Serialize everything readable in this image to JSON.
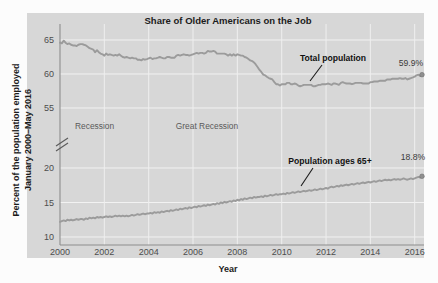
{
  "chart_data": {
    "type": "line",
    "title": "Share of Older Americans on the Job",
    "xlabel": "Year",
    "ylabel": "Percent of the population employed",
    "ylabel_line2": "January 2000–May 2016",
    "xlim": [
      2000,
      2016.42
    ],
    "x_ticks": [
      "2000",
      "2002",
      "2004",
      "2006",
      "2008",
      "2010",
      "2012",
      "2014",
      "2016"
    ],
    "x_tick_values": [
      2000,
      2002,
      2004,
      2006,
      2008,
      2010,
      2012,
      2014,
      2016
    ],
    "y_ticks_upper": [
      "65",
      "60",
      "55"
    ],
    "y_tick_values_upper": [
      65,
      60,
      55
    ],
    "y_ticks_lower": [
      "20",
      "15",
      "10"
    ],
    "y_tick_values_lower": [
      20,
      15,
      10
    ],
    "axis_break": true,
    "axis_break_note": "y-axis broken between 55 and 20",
    "grid": true,
    "legend_position": "inline-annotations",
    "line_color": "#9b9b9b",
    "panel_color": "#d7d7d7",
    "gridline_color": "#f2f2f2",
    "annotations": [
      {
        "name": "recession-2001",
        "text": "Recession",
        "x": 2001.1,
        "y": 51.0
      },
      {
        "name": "great-recession",
        "text": "Great Recession",
        "x": 2007.0,
        "y": 51.0
      },
      {
        "name": "total-population",
        "text": "Total population",
        "x": 2012.6,
        "y": 62.3
      },
      {
        "name": "population-65-plus",
        "text": "Population ages 65+",
        "x": 2012.4,
        "y": 21.6
      }
    ],
    "end_labels": [
      {
        "series": "Total population",
        "text": "59.9%",
        "value": 59.9
      },
      {
        "series": "Population ages 65+",
        "text": "18.8%",
        "value": 18.8
      }
    ],
    "series": [
      {
        "name": "Total population",
        "end_value": 59.9,
        "end_label": "59.9%",
        "x": [
          2000.0,
          2000.08,
          2000.17,
          2000.25,
          2000.33,
          2000.42,
          2000.5,
          2000.58,
          2000.67,
          2000.75,
          2000.83,
          2000.92,
          2001.0,
          2001.08,
          2001.17,
          2001.25,
          2001.33,
          2001.42,
          2001.5,
          2001.58,
          2001.67,
          2001.75,
          2001.83,
          2001.92,
          2002.0,
          2002.08,
          2002.17,
          2002.25,
          2002.33,
          2002.42,
          2002.5,
          2002.58,
          2002.67,
          2002.75,
          2002.83,
          2002.92,
          2003.0,
          2003.08,
          2003.17,
          2003.25,
          2003.33,
          2003.42,
          2003.5,
          2003.58,
          2003.67,
          2003.75,
          2003.83,
          2003.92,
          2004.0,
          2004.08,
          2004.17,
          2004.25,
          2004.33,
          2004.42,
          2004.5,
          2004.58,
          2004.67,
          2004.75,
          2004.83,
          2004.92,
          2005.0,
          2005.08,
          2005.17,
          2005.25,
          2005.33,
          2005.42,
          2005.5,
          2005.58,
          2005.67,
          2005.75,
          2005.83,
          2005.92,
          2006.0,
          2006.08,
          2006.17,
          2006.25,
          2006.33,
          2006.42,
          2006.5,
          2006.58,
          2006.67,
          2006.75,
          2006.83,
          2006.92,
          2007.0,
          2007.08,
          2007.17,
          2007.25,
          2007.33,
          2007.42,
          2007.5,
          2007.58,
          2007.67,
          2007.75,
          2007.83,
          2007.92,
          2008.0,
          2008.08,
          2008.17,
          2008.25,
          2008.33,
          2008.42,
          2008.5,
          2008.58,
          2008.67,
          2008.75,
          2008.83,
          2008.92,
          2009.0,
          2009.08,
          2009.17,
          2009.25,
          2009.33,
          2009.42,
          2009.5,
          2009.58,
          2009.67,
          2009.75,
          2009.83,
          2009.92,
          2010.0,
          2010.08,
          2010.17,
          2010.25,
          2010.33,
          2010.42,
          2010.5,
          2010.58,
          2010.67,
          2010.75,
          2010.83,
          2010.92,
          2011.0,
          2011.08,
          2011.17,
          2011.25,
          2011.33,
          2011.42,
          2011.5,
          2011.58,
          2011.67,
          2011.75,
          2011.83,
          2011.92,
          2012.0,
          2012.08,
          2012.17,
          2012.25,
          2012.33,
          2012.42,
          2012.5,
          2012.58,
          2012.67,
          2012.75,
          2012.83,
          2012.92,
          2013.0,
          2013.08,
          2013.17,
          2013.25,
          2013.33,
          2013.42,
          2013.5,
          2013.58,
          2013.67,
          2013.75,
          2013.83,
          2013.92,
          2014.0,
          2014.08,
          2014.17,
          2014.25,
          2014.33,
          2014.42,
          2014.5,
          2014.58,
          2014.67,
          2014.75,
          2014.83,
          2014.92,
          2015.0,
          2015.08,
          2015.17,
          2015.25,
          2015.33,
          2015.42,
          2015.5,
          2015.58,
          2015.67,
          2015.75,
          2015.83,
          2015.92,
          2016.0,
          2016.08,
          2016.17,
          2016.25,
          2016.33
        ],
        "y": [
          64.6,
          64.5,
          64.9,
          64.6,
          64.4,
          64.5,
          64.3,
          64.2,
          64.2,
          64.1,
          64.3,
          64.4,
          64.4,
          64.3,
          64.2,
          64.0,
          63.8,
          63.7,
          63.6,
          63.2,
          63.5,
          63.2,
          63.0,
          62.9,
          62.7,
          63.0,
          62.8,
          62.9,
          62.8,
          62.7,
          62.8,
          62.7,
          62.9,
          62.7,
          62.5,
          62.4,
          62.5,
          62.4,
          62.3,
          62.4,
          62.3,
          62.3,
          62.1,
          62.1,
          62.0,
          62.2,
          62.1,
          62.2,
          62.3,
          62.4,
          62.2,
          62.3,
          62.3,
          62.4,
          62.5,
          62.4,
          62.3,
          62.3,
          62.5,
          62.5,
          62.4,
          62.4,
          62.4,
          62.7,
          62.8,
          62.7,
          62.8,
          62.9,
          62.8,
          62.8,
          62.7,
          62.8,
          62.9,
          63.0,
          63.1,
          63.0,
          63.1,
          63.1,
          63.0,
          63.1,
          63.4,
          63.3,
          63.3,
          63.4,
          63.3,
          63.0,
          63.0,
          63.0,
          63.0,
          63.0,
          62.9,
          62.7,
          62.9,
          62.7,
          62.9,
          62.7,
          62.9,
          62.8,
          62.7,
          62.7,
          62.5,
          62.4,
          62.2,
          62.0,
          61.9,
          61.7,
          61.4,
          61.0,
          60.6,
          60.3,
          59.9,
          59.8,
          59.6,
          59.4,
          59.3,
          59.2,
          58.8,
          58.5,
          58.5,
          58.3,
          58.5,
          58.5,
          58.5,
          58.7,
          58.7,
          58.5,
          58.5,
          58.6,
          58.5,
          58.3,
          58.2,
          58.3,
          58.4,
          58.4,
          58.4,
          58.4,
          58.4,
          58.2,
          58.2,
          58.3,
          58.4,
          58.4,
          58.5,
          58.5,
          58.5,
          58.6,
          58.5,
          58.4,
          58.6,
          58.6,
          58.5,
          58.4,
          58.7,
          58.8,
          58.7,
          58.6,
          58.6,
          58.6,
          58.5,
          58.6,
          58.7,
          58.7,
          58.7,
          58.7,
          58.6,
          58.6,
          58.6,
          58.6,
          58.8,
          58.8,
          58.9,
          58.9,
          58.9,
          59.0,
          59.0,
          59.0,
          59.0,
          59.2,
          59.2,
          59.2,
          59.3,
          59.3,
          59.3,
          59.3,
          59.4,
          59.3,
          59.3,
          59.4,
          59.2,
          59.3,
          59.4,
          59.5,
          59.6,
          59.8,
          59.9,
          59.7,
          59.9
        ]
      },
      {
        "name": "Population ages 65+",
        "end_value": 18.8,
        "end_label": "18.8%",
        "x": [
          2000.0,
          2000.08,
          2000.17,
          2000.25,
          2000.33,
          2000.42,
          2000.5,
          2000.58,
          2000.67,
          2000.75,
          2000.83,
          2000.92,
          2001.0,
          2001.08,
          2001.17,
          2001.25,
          2001.33,
          2001.42,
          2001.5,
          2001.58,
          2001.67,
          2001.75,
          2001.83,
          2001.92,
          2002.0,
          2002.08,
          2002.17,
          2002.25,
          2002.33,
          2002.42,
          2002.5,
          2002.58,
          2002.67,
          2002.75,
          2002.83,
          2002.92,
          2003.0,
          2003.08,
          2003.17,
          2003.25,
          2003.33,
          2003.42,
          2003.5,
          2003.58,
          2003.67,
          2003.75,
          2003.83,
          2003.92,
          2004.0,
          2004.08,
          2004.17,
          2004.25,
          2004.33,
          2004.42,
          2004.5,
          2004.58,
          2004.67,
          2004.75,
          2004.83,
          2004.92,
          2005.0,
          2005.08,
          2005.17,
          2005.25,
          2005.33,
          2005.42,
          2005.5,
          2005.58,
          2005.67,
          2005.75,
          2005.83,
          2005.92,
          2006.0,
          2006.08,
          2006.17,
          2006.25,
          2006.33,
          2006.42,
          2006.5,
          2006.58,
          2006.67,
          2006.75,
          2006.83,
          2006.92,
          2007.0,
          2007.08,
          2007.17,
          2007.25,
          2007.33,
          2007.42,
          2007.5,
          2007.58,
          2007.67,
          2007.75,
          2007.83,
          2007.92,
          2008.0,
          2008.08,
          2008.17,
          2008.25,
          2008.33,
          2008.42,
          2008.5,
          2008.58,
          2008.67,
          2008.75,
          2008.83,
          2008.92,
          2009.0,
          2009.08,
          2009.17,
          2009.25,
          2009.33,
          2009.42,
          2009.5,
          2009.58,
          2009.67,
          2009.75,
          2009.83,
          2009.92,
          2010.0,
          2010.08,
          2010.17,
          2010.25,
          2010.33,
          2010.42,
          2010.5,
          2010.58,
          2010.67,
          2010.75,
          2010.83,
          2010.92,
          2011.0,
          2011.08,
          2011.17,
          2011.25,
          2011.33,
          2011.42,
          2011.5,
          2011.58,
          2011.67,
          2011.75,
          2011.83,
          2011.92,
          2012.0,
          2012.08,
          2012.17,
          2012.25,
          2012.33,
          2012.42,
          2012.5,
          2012.58,
          2012.67,
          2012.75,
          2012.83,
          2012.92,
          2013.0,
          2013.08,
          2013.17,
          2013.25,
          2013.33,
          2013.42,
          2013.5,
          2013.58,
          2013.67,
          2013.75,
          2013.83,
          2013.92,
          2014.0,
          2014.08,
          2014.17,
          2014.25,
          2014.33,
          2014.42,
          2014.5,
          2014.58,
          2014.67,
          2014.75,
          2014.83,
          2014.92,
          2015.0,
          2015.08,
          2015.17,
          2015.25,
          2015.33,
          2015.42,
          2015.5,
          2015.58,
          2015.67,
          2015.75,
          2015.83,
          2015.92,
          2016.0,
          2016.08,
          2016.17,
          2016.25,
          2016.33
        ],
        "y": [
          12.2,
          12.3,
          12.4,
          12.3,
          12.5,
          12.4,
          12.5,
          12.4,
          12.5,
          12.6,
          12.5,
          12.6,
          12.6,
          12.5,
          12.7,
          12.6,
          12.8,
          12.7,
          12.8,
          12.7,
          12.9,
          12.8,
          12.9,
          12.8,
          12.9,
          13.0,
          12.9,
          13.0,
          12.9,
          13.0,
          13.1,
          13.0,
          13.1,
          13.0,
          13.1,
          13.0,
          13.1,
          13.0,
          13.1,
          13.2,
          13.1,
          13.2,
          13.3,
          13.2,
          13.3,
          13.4,
          13.3,
          13.4,
          13.4,
          13.5,
          13.4,
          13.6,
          13.5,
          13.6,
          13.5,
          13.7,
          13.6,
          13.7,
          13.8,
          13.7,
          13.9,
          13.8,
          13.9,
          14.0,
          13.9,
          14.1,
          14.0,
          14.1,
          14.2,
          14.1,
          14.3,
          14.2,
          14.3,
          14.4,
          14.3,
          14.5,
          14.4,
          14.5,
          14.6,
          14.5,
          14.7,
          14.6,
          14.7,
          14.8,
          14.7,
          14.9,
          14.8,
          15.0,
          14.9,
          15.1,
          15.0,
          15.1,
          15.2,
          15.1,
          15.3,
          15.2,
          15.4,
          15.3,
          15.5,
          15.4,
          15.6,
          15.5,
          15.6,
          15.7,
          15.6,
          15.8,
          15.7,
          15.8,
          15.8,
          15.9,
          15.8,
          16.0,
          15.9,
          16.0,
          16.1,
          16.0,
          16.1,
          16.2,
          16.1,
          16.2,
          16.2,
          16.3,
          16.2,
          16.4,
          16.3,
          16.4,
          16.5,
          16.4,
          16.5,
          16.6,
          16.5,
          16.6,
          16.7,
          16.6,
          16.7,
          16.8,
          16.7,
          16.8,
          16.9,
          16.8,
          16.9,
          17.0,
          16.9,
          17.0,
          17.1,
          17.0,
          17.2,
          17.3,
          17.2,
          17.3,
          17.4,
          17.3,
          17.5,
          17.4,
          17.5,
          17.6,
          17.5,
          17.6,
          17.7,
          17.6,
          17.7,
          17.8,
          17.7,
          17.8,
          17.9,
          17.8,
          17.9,
          18.0,
          17.9,
          18.0,
          18.1,
          18.0,
          18.1,
          18.2,
          18.1,
          18.2,
          18.3,
          18.2,
          18.3,
          18.2,
          18.3,
          18.4,
          18.3,
          18.4,
          18.3,
          18.4,
          18.5,
          18.4,
          18.3,
          18.4,
          18.5,
          18.4,
          18.5,
          18.6,
          18.7,
          18.6,
          18.8
        ]
      }
    ]
  },
  "figure": {
    "title": "Share of Older Americans on the Job",
    "x_axis_title": "Year",
    "y_axis_title_line1": "Percent of the population employed",
    "y_axis_title_line2": "January 2000–May 2016"
  }
}
